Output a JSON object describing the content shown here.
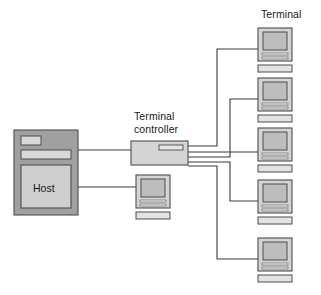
{
  "diagram": {
    "background_color": "#ffffff",
    "labels": {
      "terminal_group": "Terminal",
      "controller_line1": "Terminal",
      "controller_line2": "controller",
      "host": "Host"
    },
    "colors": {
      "host_body_fill": "#a0a0a0",
      "host_inner_fill": "#cfcfcf",
      "device_fill": "#d4d4d4",
      "screen_fill": "#bdbdbd",
      "stroke": "#4d4d4d",
      "line": "#3a3a3a",
      "text": "#1a1a1a"
    },
    "nodes": [
      {
        "name": "host",
        "type": "mainframe",
        "label": "Host",
        "x": 14,
        "y": 130,
        "width": 64,
        "height": 85
      },
      {
        "name": "terminal-controller",
        "type": "controller",
        "x": 131,
        "y": 141,
        "width": 57,
        "height": 24
      },
      {
        "name": "local-terminal",
        "type": "terminal",
        "x": 136,
        "y": 175,
        "width": 34,
        "height": 44
      },
      {
        "name": "terminal-1",
        "type": "terminal",
        "x": 258,
        "y": 28,
        "width": 34,
        "height": 44
      },
      {
        "name": "terminal-2",
        "type": "terminal",
        "x": 258,
        "y": 78,
        "width": 34,
        "height": 44
      },
      {
        "name": "terminal-3",
        "type": "terminal",
        "x": 258,
        "y": 128,
        "width": 34,
        "height": 44
      },
      {
        "name": "terminal-4",
        "type": "terminal",
        "x": 258,
        "y": 180,
        "width": 34,
        "height": 44
      },
      {
        "name": "terminal-5",
        "type": "terminal",
        "x": 258,
        "y": 238,
        "width": 34,
        "height": 44
      }
    ],
    "connections": [
      {
        "name": "host-to-controller",
        "from": "host",
        "to": "terminal-controller"
      },
      {
        "name": "host-to-local-terminal",
        "from": "host",
        "to": "local-terminal"
      },
      {
        "name": "controller-to-terminal-1",
        "from": "terminal-controller",
        "to": "terminal-1"
      },
      {
        "name": "controller-to-terminal-2",
        "from": "terminal-controller",
        "to": "terminal-2"
      },
      {
        "name": "controller-to-terminal-3",
        "from": "terminal-controller",
        "to": "terminal-3"
      },
      {
        "name": "controller-to-terminal-4",
        "from": "terminal-controller",
        "to": "terminal-4"
      },
      {
        "name": "controller-to-terminal-5",
        "from": "terminal-controller",
        "to": "terminal-5"
      }
    ],
    "counts": {
      "remote_terminals": 5,
      "local_terminals": 1,
      "controller_ports": 4
    }
  }
}
